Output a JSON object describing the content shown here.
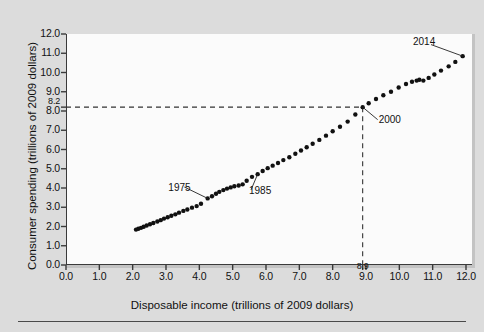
{
  "figure": {
    "background_color": "#dcdcdc",
    "plot_background_color": "#fbfbfb",
    "axis_color": "#3a3a3a",
    "marker_color": "#111111"
  },
  "chart_data": {
    "type": "scatter",
    "title": "",
    "xlabel": "Disposable income (trillions of 2009 dollars)",
    "ylabel": "Consumer spending (trillions of 2009 dollars)",
    "xlim": [
      0.0,
      12.0
    ],
    "ylim": [
      0.0,
      12.0
    ],
    "xticks": [
      "0.0",
      "1.0",
      "2.0",
      "3.0",
      "4.0",
      "5.0",
      "6.0",
      "7.0",
      "8.0",
      "9.0",
      "10.0",
      "11.0",
      "12.0"
    ],
    "xtick_values": [
      0,
      1,
      2,
      3,
      4,
      5,
      6,
      7,
      8,
      9,
      10,
      11,
      12
    ],
    "yticks": [
      "0.0",
      "1.0",
      "2.0",
      "3.0",
      "4.0",
      "5.0",
      "6.0",
      "7.0",
      "8.0",
      "9.0",
      "10.0",
      "11.0",
      "12.0"
    ],
    "ytick_values": [
      0,
      1,
      2,
      3,
      4,
      5,
      6,
      7,
      8,
      9,
      10,
      11,
      12
    ],
    "grid": false,
    "legend": "none",
    "extra_xtick": {
      "label": "8.9",
      "value": 8.9
    },
    "extra_ytick": {
      "label": "8.2",
      "value": 8.2
    },
    "reference_lines": [
      {
        "orientation": "horizontal",
        "value": 8.2,
        "style": "dashed",
        "from_x": 0.0,
        "to_x": 8.9
      },
      {
        "orientation": "vertical",
        "value": 8.9,
        "style": "dashed",
        "from_y": 0.0,
        "to_y": 8.2
      }
    ],
    "annotations": [
      {
        "label": "1975",
        "point": [
          4.25,
          3.46
        ],
        "text_x": 3.55,
        "text_y": 4.05
      },
      {
        "label": "1985",
        "point": [
          5.75,
          4.72
        ],
        "text_x": 5.55,
        "text_y": 3.9
      },
      {
        "label": "2000",
        "point": [
          8.9,
          8.2
        ],
        "text_x": 9.35,
        "text_y": 7.55
      },
      {
        "label": "2014",
        "point": [
          11.9,
          10.85
        ],
        "text_x": 10.95,
        "text_y": 11.45
      }
    ],
    "series": [
      {
        "name": "Consumer spending vs disposable income",
        "points": [
          [
            2.1,
            1.84
          ],
          [
            2.17,
            1.88
          ],
          [
            2.25,
            1.93
          ],
          [
            2.33,
            1.99
          ],
          [
            2.42,
            2.05
          ],
          [
            2.52,
            2.12
          ],
          [
            2.62,
            2.18
          ],
          [
            2.74,
            2.26
          ],
          [
            2.84,
            2.33
          ],
          [
            2.94,
            2.41
          ],
          [
            3.05,
            2.48
          ],
          [
            3.16,
            2.56
          ],
          [
            3.28,
            2.63
          ],
          [
            3.39,
            2.72
          ],
          [
            3.52,
            2.81
          ],
          [
            3.64,
            2.88
          ],
          [
            3.78,
            2.98
          ],
          [
            3.92,
            3.06
          ],
          [
            4.05,
            3.18
          ],
          [
            4.25,
            3.46
          ],
          [
            4.38,
            3.57
          ],
          [
            4.5,
            3.7
          ],
          [
            4.6,
            3.8
          ],
          [
            4.72,
            3.89
          ],
          [
            4.83,
            3.97
          ],
          [
            4.94,
            4.03
          ],
          [
            5.05,
            4.09
          ],
          [
            5.18,
            4.13
          ],
          [
            5.3,
            4.19
          ],
          [
            5.42,
            4.38
          ],
          [
            5.58,
            4.58
          ],
          [
            5.75,
            4.72
          ],
          [
            5.9,
            4.88
          ],
          [
            6.05,
            5.03
          ],
          [
            6.2,
            5.16
          ],
          [
            6.36,
            5.3
          ],
          [
            6.52,
            5.45
          ],
          [
            6.7,
            5.6
          ],
          [
            6.88,
            5.78
          ],
          [
            7.05,
            5.95
          ],
          [
            7.22,
            6.12
          ],
          [
            7.4,
            6.3
          ],
          [
            7.6,
            6.5
          ],
          [
            7.8,
            6.72
          ],
          [
            8.0,
            6.95
          ],
          [
            8.22,
            7.18
          ],
          [
            8.45,
            7.45
          ],
          [
            8.68,
            7.82
          ],
          [
            8.9,
            8.2
          ],
          [
            9.08,
            8.4
          ],
          [
            9.3,
            8.62
          ],
          [
            9.52,
            8.82
          ],
          [
            9.75,
            9.0
          ],
          [
            9.98,
            9.22
          ],
          [
            10.2,
            9.4
          ],
          [
            10.38,
            9.52
          ],
          [
            10.52,
            9.58
          ],
          [
            10.6,
            9.62
          ],
          [
            10.72,
            9.58
          ],
          [
            10.88,
            9.72
          ],
          [
            11.05,
            9.9
          ],
          [
            11.25,
            10.1
          ],
          [
            11.48,
            10.32
          ],
          [
            11.68,
            10.55
          ],
          [
            11.9,
            10.85
          ]
        ]
      }
    ]
  }
}
